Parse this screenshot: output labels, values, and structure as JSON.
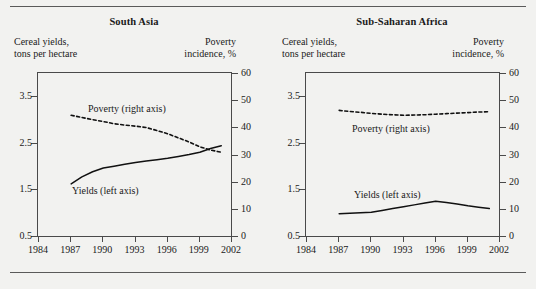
{
  "figure": {
    "background_color": "#f2f2f0",
    "rule_color": "#5a5a5a",
    "axis_color": "#4a4a4a",
    "series_color": "#111111"
  },
  "chart_data": [
    {
      "type": "line",
      "title": "South Asia",
      "ylabel": "Cereal yields,\ntons per hectare",
      "ylabel_right": "Poverty\nincidence, %",
      "xlabel": "",
      "grid": false,
      "legend_position": "inline-annotation",
      "xlim": [
        1984,
        2002
      ],
      "xticks": [
        1984,
        1987,
        1990,
        1993,
        1996,
        1999,
        2002
      ],
      "xticklabels": [
        "1984",
        "1987",
        "1990",
        "1993",
        "1996",
        "1999",
        "2002"
      ],
      "ylim": [
        0.5,
        4.0
      ],
      "yticks": [
        0.5,
        1.5,
        2.5,
        3.5
      ],
      "yticklabels": [
        "0.5",
        "1.5",
        "2.5",
        "3.5"
      ],
      "ylim_right": [
        0,
        60
      ],
      "yticks_right": [
        0,
        10,
        20,
        30,
        40,
        50,
        60
      ],
      "yticklabels_right": [
        "0",
        "10",
        "20",
        "30",
        "40",
        "50",
        "60"
      ],
      "series": [
        {
          "name": "Poverty (right axis)",
          "axis": "right",
          "style": "dashed",
          "annotation": "Poverty (right axis)",
          "x": [
            1987,
            1988,
            1989,
            1990,
            1991,
            1992,
            1993,
            1994,
            1995,
            1996,
            1997,
            1998,
            1999,
            2000,
            2001
          ],
          "values": [
            44.8,
            44.0,
            43.2,
            42.5,
            41.7,
            41.2,
            40.8,
            40.3,
            39.2,
            38.0,
            36.5,
            35.0,
            33.2,
            32.0,
            31.2
          ]
        },
        {
          "name": "Yields (left axis)",
          "axis": "left",
          "style": "solid",
          "annotation": "Yields (left axis)",
          "x": [
            1987,
            1988,
            1989,
            1990,
            1991,
            1992,
            1993,
            1994,
            1995,
            1996,
            1997,
            1998,
            1999,
            2000,
            2001
          ],
          "values": [
            1.64,
            1.79,
            1.9,
            1.98,
            2.02,
            2.06,
            2.1,
            2.13,
            2.16,
            2.19,
            2.23,
            2.27,
            2.32,
            2.4,
            2.46
          ]
        }
      ]
    },
    {
      "type": "line",
      "title": "Sub-Saharan Africa",
      "ylabel": "Cereal yields,\ntons per hectare",
      "ylabel_right": "Poverty\nincidence, %",
      "xlabel": "",
      "grid": false,
      "legend_position": "inline-annotation",
      "xlim": [
        1984,
        2002
      ],
      "xticks": [
        1984,
        1987,
        1990,
        1993,
        1996,
        1999,
        2002
      ],
      "xticklabels": [
        "1984",
        "1987",
        "1990",
        "1993",
        "1996",
        "1999",
        "2002"
      ],
      "ylim": [
        0.5,
        4.0
      ],
      "yticks": [
        0.5,
        1.5,
        2.5,
        3.5
      ],
      "yticklabels": [
        "0.5",
        "1.5",
        "2.5",
        "3.5"
      ],
      "ylim_right": [
        0,
        60
      ],
      "yticks_right": [
        0,
        10,
        20,
        30,
        40,
        50,
        60
      ],
      "yticklabels_right": [
        "0",
        "10",
        "20",
        "30",
        "40",
        "50",
        "60"
      ],
      "series": [
        {
          "name": "Poverty (right axis)",
          "axis": "right",
          "style": "dashed",
          "annotation": "Poverty (right axis)",
          "x": [
            1987,
            1988,
            1989,
            1990,
            1991,
            1992,
            1993,
            1994,
            1995,
            1996,
            1997,
            1998,
            1999,
            2000,
            2001
          ],
          "values": [
            46.6,
            46.2,
            45.9,
            45.5,
            45.2,
            45.0,
            44.8,
            44.9,
            45.0,
            45.2,
            45.4,
            45.6,
            45.8,
            46.0,
            46.1
          ]
        },
        {
          "name": "Yields (left axis)",
          "axis": "left",
          "style": "solid",
          "annotation": "Yields (left axis)",
          "x": [
            1987,
            1988,
            1989,
            1990,
            1991,
            1992,
            1993,
            1994,
            1995,
            1996,
            1997,
            1998,
            1999,
            2000,
            2001
          ],
          "values": [
            1.0,
            1.01,
            1.02,
            1.03,
            1.07,
            1.11,
            1.15,
            1.19,
            1.23,
            1.27,
            1.24,
            1.21,
            1.17,
            1.14,
            1.11
          ]
        }
      ]
    }
  ]
}
